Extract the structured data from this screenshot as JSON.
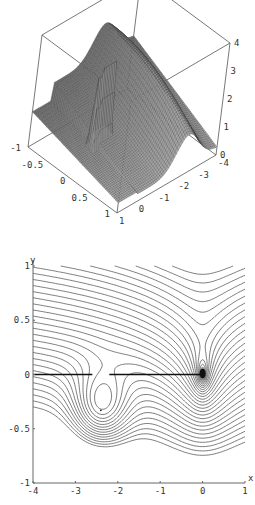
{
  "figure": {
    "panels": [
      "surface-3d",
      "contour-2d"
    ]
  },
  "chart_data": [
    {
      "type": "surface",
      "title": "",
      "x_axis": {
        "ticks": [
          "-1",
          "-0.5",
          "0",
          "0.5",
          "1"
        ],
        "range": [
          -1,
          1
        ]
      },
      "y_axis": {
        "ticks": [
          "1",
          "0",
          "-1",
          "-2",
          "-3",
          "-4"
        ],
        "range": [
          -4,
          1
        ]
      },
      "z_axis": {
        "ticks": [
          "0",
          "1",
          "2",
          "3",
          "4"
        ],
        "range": [
          0,
          4
        ]
      },
      "features": [
        "ridge along x=0 plane with spike near y=0",
        "saddle hump near y=-2.4",
        "flat plateau for y>0"
      ]
    },
    {
      "type": "contour",
      "title": "",
      "xlabel": "x",
      "ylabel": "y",
      "xlim": [
        -4,
        1
      ],
      "ylim": [
        -1,
        1
      ],
      "xticks": [
        "-4",
        "-3",
        "-2",
        "-1",
        "0",
        "1"
      ],
      "yticks": [
        "1",
        "0.5",
        "0",
        "-0.5",
        "-1"
      ],
      "features": {
        "branch_cut": {
          "from": [
            -4,
            0
          ],
          "to": [
            0,
            0
          ],
          "gap_near_x": -2.4
        },
        "center": [
          -2.4,
          -0.33
        ],
        "singularity": [
          0,
          0
        ]
      }
    }
  ]
}
